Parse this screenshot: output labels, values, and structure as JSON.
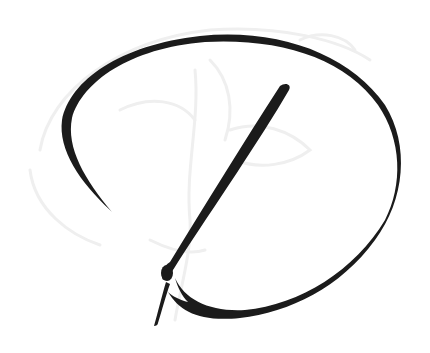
{
  "image": {
    "subject": "Calligraphic script letter D",
    "letter": "D",
    "ink_color": "#1b1b1b",
    "background_color": "#ffffff",
    "watermark_color": "#f0f0f0",
    "watermark_description": "faint floral/leaf sketch behind the letter"
  }
}
